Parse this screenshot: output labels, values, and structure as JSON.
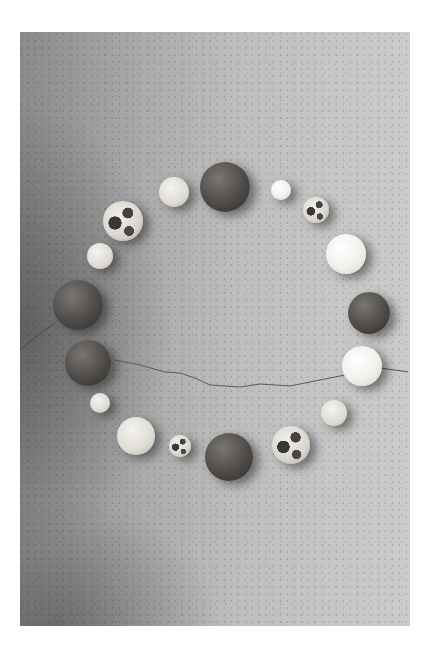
{
  "image": {
    "description": "Grayscale photograph of seventeen spheres (marbles/stone balls) arranged in a circle on a cracked concrete surface",
    "frame": {
      "x": 20,
      "y": 32,
      "width": 390,
      "height": 594
    },
    "background_color": "#ffffff",
    "surface_tone_left": "#8a8a8a",
    "surface_tone_right": "#cbcbcb"
  },
  "balls": [
    {
      "id": 1,
      "type": "dark",
      "cx": 225,
      "cy": 187,
      "r": 25
    },
    {
      "id": 2,
      "type": "cream",
      "cx": 174,
      "cy": 192,
      "r": 15
    },
    {
      "id": 3,
      "type": "white",
      "cx": 281,
      "cy": 190,
      "r": 10
    },
    {
      "id": 4,
      "type": "mottled",
      "cx": 316,
      "cy": 210,
      "r": 13
    },
    {
      "id": 5,
      "type": "mottled",
      "cx": 123,
      "cy": 221,
      "r": 20
    },
    {
      "id": 6,
      "type": "white",
      "cx": 346,
      "cy": 254,
      "r": 20
    },
    {
      "id": 7,
      "type": "cream",
      "cx": 100,
      "cy": 256,
      "r": 13
    },
    {
      "id": 8,
      "type": "dark",
      "cx": 78,
      "cy": 305,
      "r": 25
    },
    {
      "id": 9,
      "type": "dark",
      "cx": 369,
      "cy": 313,
      "r": 21
    },
    {
      "id": 10,
      "type": "dark",
      "cx": 88,
      "cy": 363,
      "r": 23
    },
    {
      "id": 11,
      "type": "white",
      "cx": 362,
      "cy": 366,
      "r": 20
    },
    {
      "id": 12,
      "type": "cream",
      "cx": 100,
      "cy": 403,
      "r": 10
    },
    {
      "id": 13,
      "type": "cream",
      "cx": 334,
      "cy": 413,
      "r": 13
    },
    {
      "id": 14,
      "type": "cream",
      "cx": 136,
      "cy": 436,
      "r": 19
    },
    {
      "id": 15,
      "type": "mottled",
      "cx": 180,
      "cy": 446,
      "r": 11
    },
    {
      "id": 16,
      "type": "mottled",
      "cx": 291,
      "cy": 445,
      "r": 19
    },
    {
      "id": 17,
      "type": "dark",
      "cx": 229,
      "cy": 457,
      "r": 24
    }
  ],
  "cracks": [
    {
      "points": "115,360 140,365 165,372 180,373 195,378 210,385 240,387 260,384 290,386 320,380 345,375"
    },
    {
      "points": "20,350 32,340 45,330 55,323"
    },
    {
      "points": "380,368 395,370 408,372"
    }
  ]
}
